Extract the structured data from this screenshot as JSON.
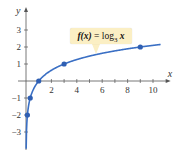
{
  "chart_data": {
    "type": "line",
    "title": "",
    "function_label": "f(x) = log3 x",
    "function_label_parts": {
      "lhs": "f(x)",
      "eq": " = log",
      "base": "3",
      "arg": " x"
    },
    "xlabel": "x",
    "ylabel": "y",
    "xlim": [
      0,
      11
    ],
    "ylim": [
      -4,
      3.6
    ],
    "x_ticks": [
      2,
      4,
      6,
      8,
      10
    ],
    "x_minor_ticks": [
      1,
      2,
      3,
      4,
      5,
      6,
      7,
      8,
      9,
      10
    ],
    "y_ticks": [
      -3,
      -2,
      -1,
      1,
      2,
      3
    ],
    "grid": false,
    "series": [
      {
        "name": "f(x) = log3 x",
        "color": "#3a6fc4",
        "highlighted_points": [
          {
            "x": 0.111,
            "y": -2
          },
          {
            "x": 0.333,
            "y": -1
          },
          {
            "x": 1,
            "y": 0
          },
          {
            "x": 3,
            "y": 1
          },
          {
            "x": 9,
            "y": 2
          }
        ]
      }
    ]
  },
  "colors": {
    "curve": "#3a6fc4",
    "point": "#2f5fb3",
    "axis": "#555555",
    "callout_bg": "#fbefc4"
  }
}
